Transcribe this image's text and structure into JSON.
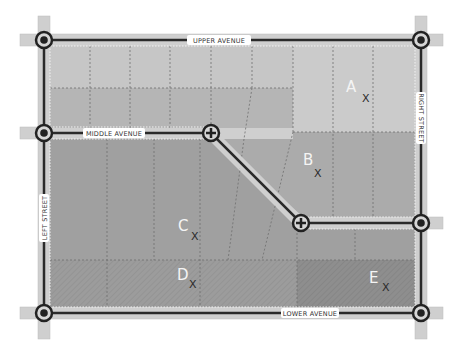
{
  "diagram": {
    "type": "site-plan",
    "roads": [
      {
        "id": "upper-avenue",
        "label": "UPPER AVENUE",
        "orientation": "horizontal"
      },
      {
        "id": "lower-avenue",
        "label": "LOWER AVENUE",
        "orientation": "horizontal"
      },
      {
        "id": "middle-avenue",
        "label": "MIDDLE AVENUE",
        "orientation": "horizontal-with-diagonal"
      },
      {
        "id": "left-street",
        "label": "LEFT STREET",
        "orientation": "vertical"
      },
      {
        "id": "right-street",
        "label": "RIGHT STREET",
        "orientation": "vertical"
      }
    ],
    "intersections": [
      {
        "id": "nw",
        "type": "roundabout"
      },
      {
        "id": "ne",
        "type": "roundabout"
      },
      {
        "id": "w-mid",
        "type": "roundabout"
      },
      {
        "id": "e-mid",
        "type": "roundabout"
      },
      {
        "id": "sw",
        "type": "roundabout"
      },
      {
        "id": "se",
        "type": "roundabout"
      },
      {
        "id": "bend-upper",
        "type": "junction-plus"
      },
      {
        "id": "bend-lower",
        "type": "junction-plus"
      }
    ],
    "lots": [
      {
        "label": "A",
        "marker": "X"
      },
      {
        "label": "B",
        "marker": "X"
      },
      {
        "label": "C",
        "marker": "X"
      },
      {
        "label": "D",
        "marker": "X"
      },
      {
        "label": "E",
        "marker": "X"
      }
    ],
    "colors": {
      "road_fill": "#c9c9c9",
      "road_line": "#2a2a2a",
      "zone_light": "#c8c8c8",
      "zone_mid": "#b4b4b4",
      "zone_a": "#cdcdcd",
      "zone_b": "#a9a9a9",
      "zone_dark": "#9e9e9e",
      "zone_hatched": "#999999",
      "zone_e": "#8c8c8c",
      "dash": "#666666"
    }
  }
}
